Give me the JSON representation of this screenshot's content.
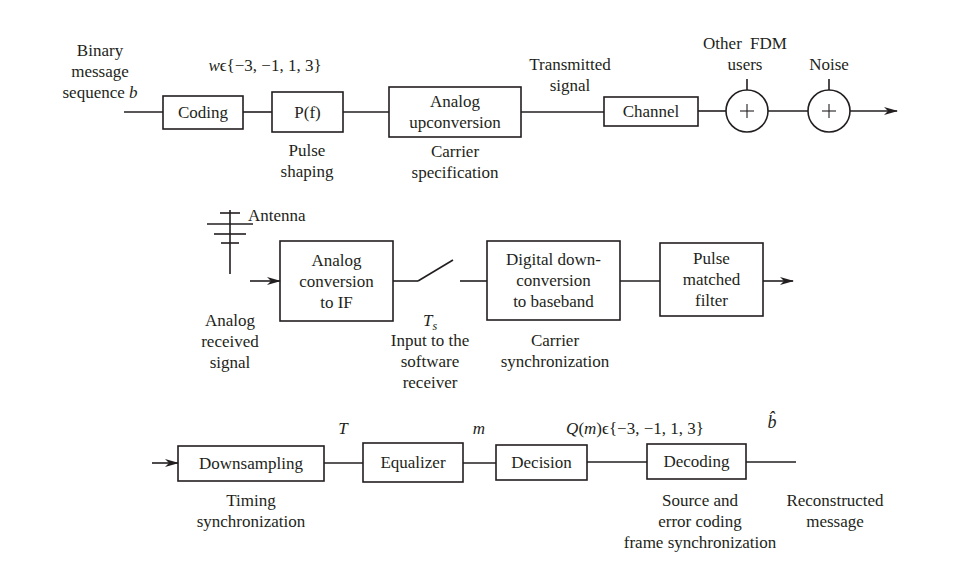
{
  "transmitter": {
    "input_label": "Binary\nmessage\nsequence",
    "input_symbol": "b",
    "alphabet_label": "wϵ{−3, −1, 1, 3}",
    "blocks": [
      {
        "id": "coding",
        "label": "Coding"
      },
      {
        "id": "pulse-filter",
        "label": "P(f)",
        "caption": "Pulse\nshaping"
      },
      {
        "id": "analog-upconversion",
        "label": "Analog\nupconversion",
        "caption": "Carrier\nspecification"
      },
      {
        "id": "channel",
        "label": "Channel"
      }
    ],
    "transmitted_label": "Transmitted\nsignal",
    "adders": [
      {
        "id": "fdm-adder",
        "symbol": "+",
        "label": "Other FDM\nusers"
      },
      {
        "id": "noise-adder",
        "symbol": "+",
        "label": "Noise"
      }
    ]
  },
  "receiver_front": {
    "antenna_label": "Antenna",
    "input_label": "Analog\nreceived\nsignal",
    "blocks": [
      {
        "id": "analog-conversion-if",
        "label": "Analog\nconversion\nto IF"
      },
      {
        "id": "digital-downconversion",
        "label": "Digital down-\nconversion\nto baseband",
        "caption": "Carrier\nsynchronization"
      },
      {
        "id": "pulse-matched-filter",
        "label": "Pulse\nmatched\nfilter"
      }
    ],
    "sampler_symbol": "T",
    "sampler_subscript": "s",
    "sampler_caption": "Input to the\nsoftware\nreceiver"
  },
  "receiver_back": {
    "blocks": [
      {
        "id": "downsampling",
        "label": "Downsampling",
        "caption": "Timing\nsynchronization"
      },
      {
        "id": "equalizer",
        "label": "Equalizer"
      },
      {
        "id": "decision",
        "label": "Decision"
      },
      {
        "id": "decoding",
        "label": "Decoding",
        "caption": "Source and\nerror coding\nframe synchronization"
      }
    ],
    "period_symbol": "T",
    "equalizer_output_symbol": "m",
    "decision_output_label": "Q(m)ϵ{−3, −1, 1, 3}",
    "output_symbol": "b̂",
    "output_label": "Reconstructed\nmessage"
  }
}
